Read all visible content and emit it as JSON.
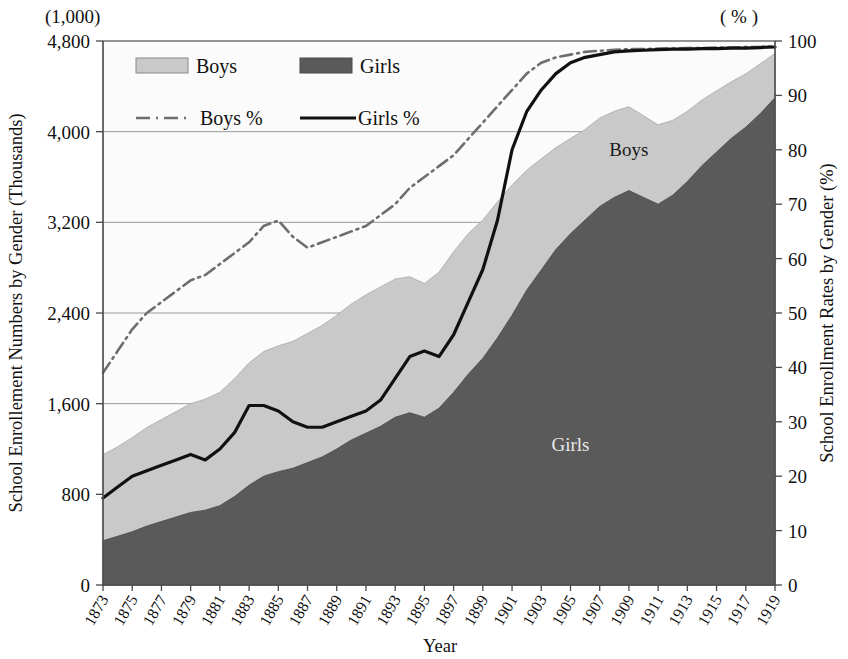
{
  "chart_data": {
    "type": "area",
    "title": "",
    "xlabel": "Year",
    "left_axis": {
      "label": "School Enrollement Numbers by Gender  (Thousands)",
      "unit_note": "(1,000)",
      "ticks": [
        0,
        800,
        1600,
        2400,
        3200,
        4000,
        4800
      ],
      "tick_labels": [
        "0",
        "800",
        "1,600",
        "2,400",
        "3,200",
        "4,000",
        "4,800"
      ],
      "ylim": [
        0,
        4800
      ]
    },
    "right_axis": {
      "label": "School Enrollment Rates by Gender (%)",
      "unit_note": "( % )",
      "ticks": [
        0,
        10,
        20,
        30,
        40,
        50,
        60,
        70,
        80,
        90,
        100
      ],
      "tick_labels": [
        "0",
        "10",
        "20",
        "30",
        "40",
        "50",
        "60",
        "70",
        "80",
        "90",
        "100"
      ],
      "ylim": [
        0,
        100
      ]
    },
    "grid": "horizontal-left-axis",
    "legend_position": "top-inside",
    "x": [
      1873,
      1874,
      1875,
      1876,
      1877,
      1878,
      1879,
      1880,
      1881,
      1882,
      1883,
      1884,
      1885,
      1886,
      1887,
      1888,
      1889,
      1890,
      1891,
      1892,
      1893,
      1894,
      1895,
      1896,
      1897,
      1898,
      1899,
      1900,
      1901,
      1902,
      1903,
      1904,
      1905,
      1906,
      1907,
      1908,
      1909,
      1910,
      1911,
      1912,
      1913,
      1914,
      1915,
      1916,
      1917,
      1918,
      1919
    ],
    "tick_years": [
      1873,
      1875,
      1877,
      1879,
      1881,
      1883,
      1885,
      1887,
      1889,
      1891,
      1893,
      1895,
      1897,
      1899,
      1901,
      1903,
      1905,
      1907,
      1909,
      1911,
      1913,
      1915,
      1917,
      1919
    ],
    "series": [
      {
        "name": "Girls",
        "kind": "area-stacked",
        "color": "#5a5a5a",
        "values": [
          390,
          430,
          470,
          520,
          560,
          600,
          640,
          660,
          700,
          780,
          880,
          960,
          1000,
          1030,
          1080,
          1130,
          1200,
          1280,
          1340,
          1400,
          1480,
          1520,
          1480,
          1560,
          1700,
          1860,
          2000,
          2180,
          2380,
          2600,
          2780,
          2960,
          3100,
          3220,
          3340,
          3420,
          3480,
          3420,
          3360,
          3440,
          3560,
          3700,
          3820,
          3940,
          4040,
          4160,
          4300
        ]
      },
      {
        "name": "Boys",
        "kind": "area-stacked",
        "color": "#c9c9c9",
        "values": [
          760,
          790,
          830,
          870,
          900,
          930,
          960,
          980,
          1000,
          1040,
          1080,
          1100,
          1110,
          1120,
          1140,
          1160,
          1180,
          1200,
          1220,
          1230,
          1220,
          1200,
          1180,
          1200,
          1240,
          1240,
          1220,
          1200,
          1150,
          1060,
          980,
          900,
          840,
          800,
          780,
          760,
          740,
          720,
          700,
          660,
          620,
          580,
          540,
          500,
          470,
          440,
          390
        ]
      },
      {
        "name": "Boys %",
        "kind": "line",
        "style": "dash-dot",
        "color": "#6e6e6e",
        "axis": "right",
        "values": [
          39,
          43,
          47,
          50,
          52,
          54,
          56,
          57,
          59,
          61,
          63,
          66,
          67,
          64,
          62,
          63,
          64,
          65,
          66,
          68,
          70,
          73,
          75,
          77,
          79,
          82,
          85,
          88,
          91,
          94,
          96,
          97,
          97.5,
          98,
          98.2,
          98.4,
          98.5,
          98.5,
          98.6,
          98.6,
          98.7,
          98.7,
          98.8,
          98.8,
          98.9,
          98.9,
          99
        ]
      },
      {
        "name": "Girls %",
        "kind": "line",
        "style": "solid",
        "color": "#111111",
        "axis": "right",
        "values": [
          16,
          18,
          20,
          21,
          22,
          23,
          24,
          23,
          25,
          28,
          33,
          33,
          32,
          30,
          29,
          29,
          30,
          31,
          32,
          34,
          38,
          42,
          43,
          42,
          46,
          52,
          58,
          67,
          80,
          87,
          91,
          94,
          96,
          97,
          97.5,
          98,
          98.2,
          98.3,
          98.4,
          98.5,
          98.5,
          98.6,
          98.6,
          98.7,
          98.7,
          98.8,
          98.9
        ]
      }
    ],
    "annotations": [
      {
        "text": "Boys",
        "x": 1909,
        "tone": "dark"
      },
      {
        "text": "Girls",
        "x": 1905,
        "tone": "light"
      }
    ]
  },
  "legend": {
    "items": [
      {
        "label": "Boys",
        "marker": "swatch-light"
      },
      {
        "label": "Girls",
        "marker": "swatch-dark"
      },
      {
        "label": "Boys %",
        "marker": "line-dash-dot"
      },
      {
        "label": "Girls %",
        "marker": "line-solid"
      }
    ]
  },
  "colors": {
    "boys_fill": "#c9c9c9",
    "girls_fill": "#5a5a5a",
    "boys_pct_line": "#6e6e6e",
    "girls_pct_line": "#111111",
    "grid": "#9a9a9a",
    "frame": "#6e6e6e",
    "text": "#111111"
  }
}
